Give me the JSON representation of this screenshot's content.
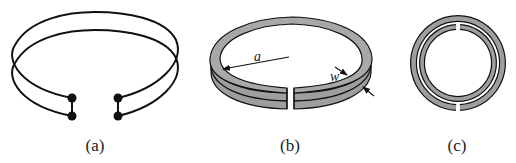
{
  "figure": {
    "panels": [
      {
        "id": "a",
        "caption": "(a)",
        "description": "Two-turn loop with terminals (four dots) at the gap"
      },
      {
        "id": "b",
        "caption": "(b)",
        "description": "Split ring with radius a and strip width w",
        "annotations": {
          "radius_label": "a",
          "width_label": "w"
        }
      },
      {
        "id": "c",
        "caption": "(c)",
        "description": "Top view of double split-ring resonator, outer gap at bottom, inner gap at top"
      }
    ],
    "colors": {
      "stroke": "#111111",
      "fill_ring": "#9e9e9e",
      "background": "#ffffff"
    }
  }
}
